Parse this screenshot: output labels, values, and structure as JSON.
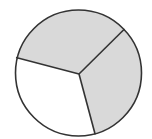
{
  "diagram": {
    "type": "divided-circle",
    "center": [
      78.5,
      73
    ],
    "spoke_origin": [
      79,
      74
    ],
    "radius": 63,
    "stroke_color": "#333333",
    "stroke_width": 1.6,
    "sectors": [
      {
        "name": "top-left-sector",
        "shaded": true,
        "fill": "#d9d9d9",
        "start_point": [
          17.5,
          57.4
        ],
        "end_point": [
          124.0,
          29.5
        ],
        "sweep_deg": 122
      },
      {
        "name": "right-sector",
        "shaded": true,
        "fill": "#d9d9d9",
        "start_point": [
          124.0,
          29.5
        ],
        "end_point": [
          95.0,
          133.8
        ],
        "sweep_deg": 118.5
      },
      {
        "name": "bottom-left-sector",
        "shaded": false,
        "fill": "#ffffff",
        "start_point": [
          95.0,
          133.8
        ],
        "end_point": [
          17.5,
          57.4
        ],
        "sweep_deg": 119.5
      }
    ],
    "shaded_fraction_label": "2/3",
    "total_parts": 3,
    "shaded_parts": 2
  }
}
